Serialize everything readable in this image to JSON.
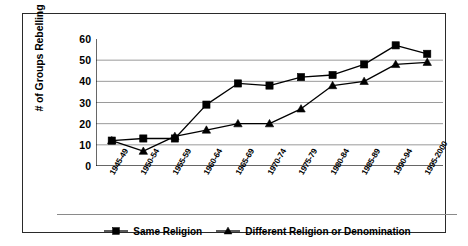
{
  "chart_data": {
    "type": "line",
    "title": "",
    "xlabel": "",
    "ylabel": "# of Groups Rebelling",
    "ylim": [
      0,
      60
    ],
    "yticks": [
      0,
      10,
      20,
      30,
      40,
      50,
      60
    ],
    "grid": true,
    "legend_position": "bottom",
    "categories": [
      "1945-49",
      "1950-54",
      "1955-59",
      "1960-64",
      "1965-69",
      "1970-74",
      "1975-79",
      "1980-84",
      "1985-89",
      "1990-94",
      "1995-2000"
    ],
    "series": [
      {
        "name": "Same Religion",
        "marker": "square",
        "color": "#000000",
        "values": [
          12,
          13,
          13,
          29,
          39,
          38,
          42,
          43,
          48,
          57,
          53
        ]
      },
      {
        "name": "Different Religion or Denomination",
        "marker": "triangle",
        "color": "#000000",
        "values": [
          12,
          7,
          14,
          17,
          20,
          20,
          27,
          38,
          40,
          48,
          49
        ]
      }
    ]
  },
  "axis": {
    "y_title": "# of Groups Rebelling",
    "y_tick_labels": [
      "60",
      "50",
      "40",
      "30",
      "20",
      "10",
      "0"
    ]
  },
  "legend": {
    "items": [
      {
        "label": "Same Religion",
        "marker": "square"
      },
      {
        "label": "Different Religion or Denomination",
        "marker": "triangle"
      }
    ]
  },
  "colors": {
    "line": "#000000",
    "grid": "#9a9a9a",
    "frame": "#2a2a2a",
    "background": "#ffffff"
  }
}
